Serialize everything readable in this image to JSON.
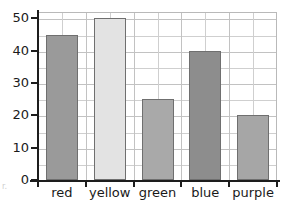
{
  "chart_data": {
    "type": "bar",
    "title": "",
    "subtitle": "",
    "xlabel": "",
    "ylabel": "",
    "categories": [
      "red",
      "yellow",
      "green",
      "blue",
      "purple"
    ],
    "values": [
      45,
      50,
      25,
      40,
      20
    ],
    "ylim": [
      0,
      52
    ],
    "ytick_values": [
      0,
      10,
      20,
      30,
      40,
      50
    ],
    "ytick_labels": [
      "0",
      "10",
      "20",
      "30",
      "40",
      "50"
    ],
    "minor_gridline_step": 5,
    "grid": "on",
    "legend": "none",
    "annotations": [],
    "bar_colors": [
      "#9a9a9a",
      "#e3e3e3",
      "#a9a9a9",
      "#8d8d8d",
      "#a6a6a6"
    ],
    "bar_edge_color": "#6f6f6f"
  },
  "axes": {
    "axis_line_color": "#1d1d1d",
    "grid_color": "#cfcfcf",
    "plot_border_color": "#b9b9b9"
  },
  "artifacts": {
    "left_margin_mark": "r."
  }
}
